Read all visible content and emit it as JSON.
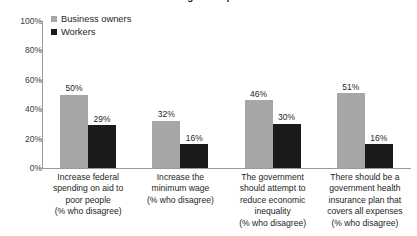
{
  "chart_data": {
    "type": "bar",
    "title": "...the general public",
    "subtitle": "",
    "xlabel": "",
    "ylabel": "",
    "ylim": [
      0,
      100
    ],
    "y_ticks": [
      "0%",
      "20%",
      "40%",
      "60%",
      "80%",
      "100%"
    ],
    "y_tick_values": [
      0,
      20,
      40,
      60,
      80,
      100
    ],
    "grid": false,
    "legend_position": "top-left",
    "categories": [
      "Increase federal spending on aid to poor people (% who disagree)",
      "Increase the minimum wage (% who disagree)",
      "The government should attempt to reduce economic inequality (% who disagree)",
      "There should be a government health insurance plan that covers all expenses (% who disagree)"
    ],
    "category_lines": [
      [
        "Increase federal",
        "spending on aid to",
        "poor people",
        "(% who disagree)"
      ],
      [
        "Increase the",
        "minimum wage",
        "(% who disagree)"
      ],
      [
        "The government",
        "should attempt to",
        "reduce economic",
        "inequality",
        "(% who disagree)"
      ],
      [
        "There should be a",
        "government health",
        "insurance plan that",
        "covers all expenses",
        "(% who disagree)"
      ]
    ],
    "series": [
      {
        "name": "Business owners",
        "color": "#a6a6a6",
        "values": [
          50,
          32,
          46,
          51
        ],
        "value_labels": [
          "50%",
          "32%",
          "46%",
          "51%"
        ]
      },
      {
        "name": "Workers",
        "color": "#1a1a1a",
        "values": [
          29,
          16,
          30,
          16
        ],
        "value_labels": [
          "29%",
          "16%",
          "30%",
          "16%"
        ]
      }
    ]
  },
  "legend": {
    "items": [
      {
        "label": "Business owners",
        "color": "#a6a6a6"
      },
      {
        "label": "Workers",
        "color": "#1a1a1a"
      }
    ]
  }
}
